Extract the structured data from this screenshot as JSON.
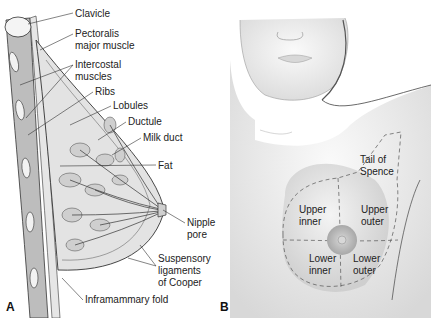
{
  "panels": {
    "a": {
      "letter": "A",
      "labels": [
        {
          "id": "clavicle",
          "text": "Clavicle",
          "x": 75,
          "y": 8
        },
        {
          "id": "pectoralis",
          "text": "Pectoralis\nmajor muscle",
          "x": 75,
          "y": 30
        },
        {
          "id": "intercostal",
          "text": "Intercostal\nmuscles",
          "x": 75,
          "y": 60
        },
        {
          "id": "ribs",
          "text": "Ribs",
          "x": 95,
          "y": 86
        },
        {
          "id": "lobules",
          "text": "Lobules",
          "x": 113,
          "y": 100
        },
        {
          "id": "ductule",
          "text": "Ductule",
          "x": 128,
          "y": 116
        },
        {
          "id": "milk_duct",
          "text": "Milk duct",
          "x": 143,
          "y": 132
        },
        {
          "id": "fat",
          "text": "Fat",
          "x": 158,
          "y": 160
        },
        {
          "id": "nipple_pore",
          "text": "Nipple\npore",
          "x": 187,
          "y": 217
        },
        {
          "id": "suspensory",
          "text": "Suspensory\nligaments\nof Cooper",
          "x": 158,
          "y": 255
        },
        {
          "id": "inframammary",
          "text": "Inframammary fold",
          "x": 85,
          "y": 296
        }
      ]
    },
    "b": {
      "letter": "B",
      "labels": [
        {
          "id": "tail_spence",
          "text": "Tail of\nSpence",
          "x": 360,
          "y": 154
        },
        {
          "id": "upper_inner",
          "text": "Upper\ninner",
          "x": 299,
          "y": 204
        },
        {
          "id": "upper_outer",
          "text": "Upper\nouter",
          "x": 361,
          "y": 204
        },
        {
          "id": "lower_inner",
          "text": "Lower\ninner",
          "x": 309,
          "y": 253
        },
        {
          "id": "lower_outer",
          "text": "Lower\nouter",
          "x": 353,
          "y": 253
        }
      ]
    }
  }
}
